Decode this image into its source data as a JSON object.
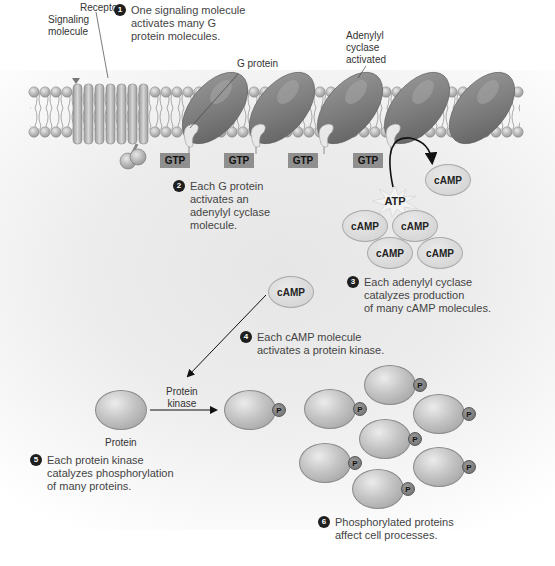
{
  "labels": {
    "receptor": "Receptor",
    "signaling_molecule": "Signaling\nmolecule",
    "g_protein": "G protein",
    "adenylyl_cyclase": "Adenylyl\ncyclase\nactivated",
    "protein_kinase": "Protein\nkinase",
    "protein": "Protein",
    "atp": "ATP"
  },
  "gtp_tags": [
    "GTP",
    "GTP",
    "GTP",
    "GTP"
  ],
  "camp_molecules": [
    "cAMP",
    "cAMP",
    "cAMP",
    "cAMP",
    "cAMP",
    "cAMP"
  ],
  "phosphate_label": "P",
  "steps": [
    {
      "number": "1",
      "text": "One signaling molecule\nactivates many G\nprotein molecules."
    },
    {
      "number": "2",
      "text": "Each G protein\nactivates an\nadenylyl cyclase\nmolecule."
    },
    {
      "number": "3",
      "text": "Each adenylyl cyclase\ncatalyzes production\nof many cAMP molecules."
    },
    {
      "number": "4",
      "text": "Each cAMP molecule\nactivates a protein kinase."
    },
    {
      "number": "5",
      "text": "Each protein kinase\ncatalyzes phosphorylation\nof many proteins."
    },
    {
      "number": "6",
      "text": "Phosphorylated proteins\naffect cell processes."
    }
  ],
  "colors": {
    "membrane_head": "#b9b9b9",
    "protein_dark": "#7a7a7a",
    "gtp_box": "#8f8f8f",
    "number_badge": "#1e1e1e"
  }
}
